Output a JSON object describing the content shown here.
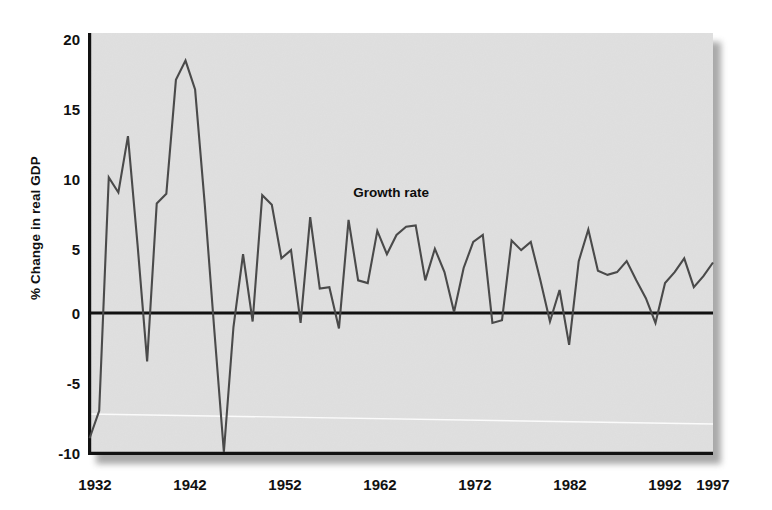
{
  "chart_data": {
    "type": "line",
    "title": "",
    "xlabel": "",
    "ylabel": "% Change in real GDP",
    "ylim": [
      -10,
      20
    ],
    "xlim": [
      1932,
      1997
    ],
    "yticks": [
      20,
      15,
      10,
      5,
      0,
      -5,
      -10
    ],
    "ytick_labels": [
      "20",
      "15",
      "10",
      "5",
      "0",
      "-5",
      "-10"
    ],
    "xticks": [
      1932,
      1942,
      1952,
      1962,
      1972,
      1982,
      1992,
      1997
    ],
    "xtick_labels": [
      "1932",
      "1942",
      "1952",
      "1962",
      "1972",
      "1982",
      "1992",
      "1997"
    ],
    "grid": false,
    "legend_position": "inline-annotation",
    "annotations": [
      {
        "text": "Growth rate",
        "x": 1959.5,
        "y": 8.6
      }
    ],
    "series": [
      {
        "name": "Growth rate",
        "color": "#4a4a4a",
        "x": [
          1932,
          1933,
          1934,
          1935,
          1936,
          1937,
          1938,
          1939,
          1940,
          1941,
          1942,
          1943,
          1944,
          1945,
          1946,
          1947,
          1948,
          1949,
          1950,
          1951,
          1952,
          1953,
          1954,
          1955,
          1956,
          1957,
          1958,
          1959,
          1960,
          1961,
          1962,
          1963,
          1964,
          1965,
          1966,
          1967,
          1968,
          1969,
          1970,
          1971,
          1972,
          1973,
          1974,
          1975,
          1976,
          1977,
          1978,
          1979,
          1980,
          1981,
          1982,
          1983,
          1984,
          1985,
          1986,
          1987,
          1988,
          1989,
          1990,
          1991,
          1992,
          1993,
          1994,
          1995,
          1996,
          1997
        ],
        "y": [
          -9.0,
          -7.0,
          10.0,
          8.9,
          13.0,
          5.1,
          -3.4,
          8.1,
          8.8,
          17.1,
          18.5,
          16.4,
          8.1,
          -1.1,
          -11.0,
          -0.9,
          4.4,
          -0.5,
          8.7,
          8.0,
          4.1,
          4.7,
          -0.6,
          7.1,
          1.9,
          2.0,
          -1.0,
          6.9,
          2.5,
          2.3,
          6.1,
          4.4,
          5.8,
          6.4,
          6.5,
          2.5,
          4.8,
          3.1,
          0.2,
          3.4,
          5.3,
          5.8,
          -0.6,
          -0.4,
          5.4,
          4.7,
          5.3,
          2.5,
          -0.5,
          1.8,
          -2.2,
          3.9,
          6.2,
          3.2,
          2.9,
          3.1,
          3.9,
          2.5,
          1.2,
          -0.6,
          2.3,
          3.1,
          4.1,
          2.0,
          2.8,
          3.8
        ]
      }
    ],
    "values": [
      -9.0,
      -7.0,
      10.0,
      8.9,
      13.0,
      5.1,
      -3.4,
      8.1,
      8.8,
      17.1,
      18.5,
      16.4,
      8.1,
      -1.1,
      -11.0,
      -0.9,
      4.4,
      -0.5,
      8.7,
      8.0,
      4.1,
      4.7,
      -0.6,
      7.1,
      1.9,
      2.0,
      -1.0,
      6.9,
      2.5,
      2.3,
      6.1,
      4.4,
      5.8,
      6.4,
      6.5,
      2.5,
      4.8,
      3.1,
      0.2,
      3.4,
      5.3,
      5.8,
      -0.6,
      -0.4,
      5.4,
      4.7,
      5.3,
      2.5,
      -0.5,
      1.8,
      -2.2,
      3.9,
      6.2,
      3.2,
      2.9,
      3.1,
      3.9,
      2.5,
      1.2,
      -0.6,
      2.3,
      3.1,
      4.1,
      2.0,
      2.8,
      3.8
    ],
    "categories": [
      1932,
      1933,
      1934,
      1935,
      1936,
      1937,
      1938,
      1939,
      1940,
      1941,
      1942,
      1943,
      1944,
      1945,
      1946,
      1947,
      1948,
      1949,
      1950,
      1951,
      1952,
      1953,
      1954,
      1955,
      1956,
      1957,
      1958,
      1959,
      1960,
      1961,
      1962,
      1963,
      1964,
      1965,
      1966,
      1967,
      1968,
      1969,
      1970,
      1971,
      1972,
      1973,
      1974,
      1975,
      1976,
      1977,
      1978,
      1979,
      1980,
      1981,
      1982,
      1983,
      1984,
      1985,
      1986,
      1987,
      1988,
      1989,
      1990,
      1991,
      1992,
      1993,
      1994,
      1995,
      1996,
      1997
    ],
    "zero_reference_line": 0,
    "colors": {
      "plot_background": "#e0e0e0",
      "line": "#4a4a4a",
      "axis": "#111111",
      "page_background": "#ffffff"
    }
  }
}
